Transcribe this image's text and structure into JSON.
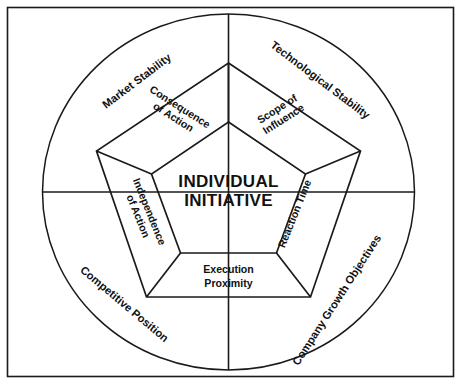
{
  "diagram": {
    "title": "INDIVIDUAL INITIATIVE",
    "center": {
      "line1": "INDIVIDUAL",
      "line2": "INITIATIVE"
    },
    "inner_band_labels": [
      {
        "id": "consequence-of-action",
        "line1": "Consequence",
        "line2": "of Action"
      },
      {
        "id": "scope-of-influence",
        "line1": "Scope of",
        "line2": "Influence"
      },
      {
        "id": "reaction-time",
        "line1": "Reaction Time",
        "line2": ""
      },
      {
        "id": "execution-proximity",
        "line1": "Execution",
        "line2": "Proximity"
      },
      {
        "id": "independence-of-action",
        "line1": "Independence",
        "line2": "of Action"
      }
    ],
    "outer_ring_labels": [
      {
        "id": "market-stability",
        "text": "Market Stability"
      },
      {
        "id": "technological-stability",
        "text": "Technological Stability"
      },
      {
        "id": "company-growth-objectives",
        "text": "Company Growth Objectives"
      },
      {
        "id": "competitive-position",
        "text": "Competitive Position"
      },
      {
        "id": "competitive-position-2",
        "text": "Competitive Position"
      }
    ],
    "colors": {
      "stroke": "#1a1a1a",
      "background": "#ffffff",
      "text": "#111111"
    }
  }
}
